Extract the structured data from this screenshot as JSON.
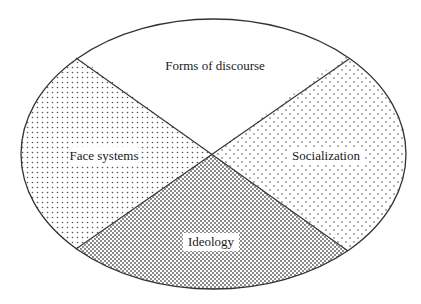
{
  "diagram": {
    "type": "ellipse-quadrant",
    "ellipse": {
      "cx": 213.5,
      "cy": 154,
      "rx": 192.5,
      "ry": 135
    },
    "lines": [
      {
        "x1": 76,
        "y1": 58,
        "x2": 348,
        "y2": 251
      },
      {
        "x1": 349,
        "y1": 59,
        "x2": 76,
        "y2": 249
      }
    ],
    "sections": [
      {
        "id": "top",
        "label": "Forms of discourse",
        "fill": "none"
      },
      {
        "id": "left",
        "label": "Face systems",
        "fill": "medium-dots"
      },
      {
        "id": "right",
        "label": "Socialization",
        "fill": "sparse-dots"
      },
      {
        "id": "bottom",
        "label": "Ideology",
        "fill": "dense-dots"
      }
    ],
    "colors": {
      "stroke": "#333333",
      "dot": "#555555",
      "background": "#ffffff"
    }
  }
}
